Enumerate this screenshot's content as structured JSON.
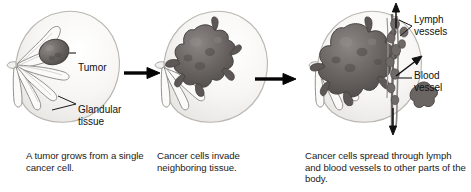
{
  "figure": {
    "background_color": "#ffffff",
    "ink_color": "#1a1a1a"
  },
  "panels": [
    {
      "id": "panel-1",
      "stage": 1,
      "caption": "A tumor grows from a single cancer cell.",
      "labels": [
        {
          "name": "tumor",
          "text": "Tumor"
        },
        {
          "name": "glandular-tissue",
          "text": "Glandular tissue"
        }
      ]
    },
    {
      "id": "panel-2",
      "stage": 2,
      "caption": "Cancer cells invade neighboring tissue.",
      "labels": []
    },
    {
      "id": "panel-3",
      "stage": 3,
      "caption": "Cancer cells spread through lymph and blood vessels to other parts of the body.",
      "labels": [
        {
          "name": "lymph-vessels",
          "text": "Lymph vessels"
        },
        {
          "name": "blood-vessel",
          "text": "Blood vessel"
        }
      ]
    }
  ],
  "labels": {
    "tumor": "Tumor",
    "glandular_tissue_line1": "Glandular",
    "glandular_tissue_line2": "tissue",
    "lymph_vessels_line1": "Lymph",
    "lymph_vessels_line2": "vessels",
    "blood_vessel_line1": "Blood",
    "blood_vessel_line2": "vessel"
  },
  "captions": {
    "panel1": "A tumor grows from a single cancer cell.",
    "panel2": "Cancer cells invade neighboring tissue.",
    "panel3": "Cancer cells spread through lymph and blood vessels to other parts of the body."
  },
  "colors": {
    "tumor_dark": "#595552",
    "tumor_mid": "#7d7874",
    "duct_outline": "#8d8b86",
    "breast_outline": "#b9b6b1",
    "breast_fill": "#f6f5f3",
    "vessel": "#6e6a66",
    "arrow": "#050505",
    "leader": "#1a1a1a"
  }
}
